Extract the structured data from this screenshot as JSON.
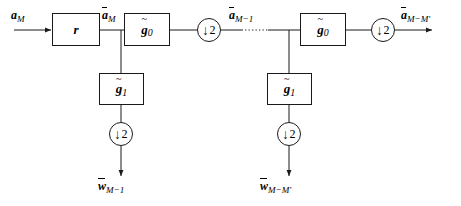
{
  "diagram": {
    "stroke_color": "#1a1a1a",
    "background": "#ffffff",
    "blocks": [
      {
        "id": "r",
        "label_plain": "r",
        "base": "r",
        "x": 52,
        "y": 13,
        "w": 48,
        "h": 33
      },
      {
        "id": "g0-left",
        "label_plain": "g0",
        "base": "g",
        "sub": "0",
        "x": 124,
        "y": 13,
        "w": 46,
        "h": 33
      },
      {
        "id": "g1-left",
        "label_plain": "g1",
        "base": "g",
        "sub": "1",
        "x": 99,
        "y": 73,
        "w": 45,
        "h": 32
      },
      {
        "id": "g0-right",
        "label_plain": "g0",
        "base": "g",
        "sub": "0",
        "x": 300,
        "y": 13,
        "w": 46,
        "h": 33
      },
      {
        "id": "g1-right",
        "label_plain": "g1",
        "base": "g",
        "sub": "1",
        "x": 267,
        "y": 73,
        "w": 45,
        "h": 32
      }
    ],
    "downsamplers": [
      {
        "id": "ds-top-left",
        "label": "2",
        "arrow": "↓",
        "cx": 209,
        "cy": 30,
        "r": 12
      },
      {
        "id": "ds-top-right",
        "label": "2",
        "arrow": "↓",
        "cx": 383,
        "cy": 30,
        "r": 12
      },
      {
        "id": "ds-bot-left",
        "label": "2",
        "arrow": "↓",
        "cx": 121,
        "cy": 134,
        "r": 12
      },
      {
        "id": "ds-bot-right",
        "label": "2",
        "arrow": "↓",
        "cx": 289,
        "cy": 134,
        "r": 12
      }
    ],
    "signal_labels": [
      {
        "id": "input",
        "base": "a",
        "overbar": false,
        "sub": "M",
        "x": 10,
        "y": 8
      },
      {
        "id": "a-bar-M",
        "base": "a",
        "overbar": true,
        "sub": "M",
        "x": 101,
        "y": 8
      },
      {
        "id": "a-bar-M-1",
        "base": "a",
        "overbar": true,
        "sub": "M−1",
        "x": 228,
        "y": 8
      },
      {
        "id": "a-bar-M-Mp",
        "base": "a",
        "overbar": true,
        "sub": "M−M′",
        "x": 402,
        "y": 8
      },
      {
        "id": "w-bar-M-1",
        "base": "w",
        "overbar": true,
        "sub": "M−1",
        "x": 97,
        "y": 179
      },
      {
        "id": "w-bar-M-Mp",
        "base": "w",
        "overbar": true,
        "sub": "M−M′",
        "x": 261,
        "y": 179
      }
    ]
  }
}
